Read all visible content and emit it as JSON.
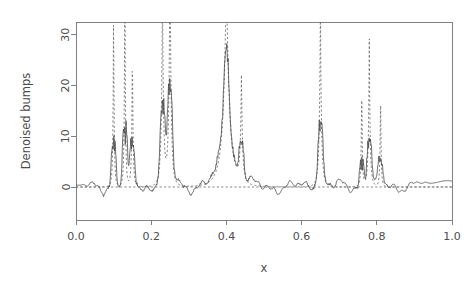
{
  "chart_data": {
    "type": "line",
    "title": "",
    "xlabel": "x",
    "ylabel": "Denoised bumps",
    "xlim": [
      0.0,
      1.0
    ],
    "ylim": [
      -6.5,
      32.5
    ],
    "xticks": [
      0.0,
      0.2,
      0.4,
      0.6,
      0.8,
      1.0
    ],
    "xticklabels": [
      "0.0",
      "0.2",
      "0.4",
      "0.6",
      "0.8",
      "1.0"
    ],
    "yticks": [
      0,
      10,
      20,
      30
    ],
    "yticklabels": [
      "0",
      "10",
      "20",
      "30"
    ],
    "grid": false,
    "legend": "none",
    "zero_reference": 0,
    "series": [
      {
        "name": "True bumps signal",
        "style": "dashed",
        "color": "#6f6f6f",
        "description": "Donoho-Johnstone bumps test function: narrow spikes on a zero baseline",
        "bump_positions": [
          0.1,
          0.13,
          0.15,
          0.23,
          0.25,
          0.4,
          0.44,
          0.65,
          0.76,
          0.78,
          0.81
        ],
        "bump_heights": [
          40.0,
          50.1,
          30.1,
          40.0,
          50.2,
          42.4,
          21.6,
          36.0,
          24.1,
          30.0,
          21.1
        ],
        "bump_widths": [
          0.005,
          0.005,
          0.006,
          0.01,
          0.01,
          0.03,
          0.01,
          0.01,
          0.005,
          0.008,
          0.005
        ]
      },
      {
        "name": "Denoised estimate",
        "style": "solid",
        "color": "#4a4a4a",
        "description": "Wavelet-thresholded reconstruction of noisy bumps; tracks peaks with oscillatory artifacts near discontinuities"
      }
    ],
    "n_points": 1024
  },
  "axes": {
    "y_title": "Denoised bumps",
    "x_title": "x"
  }
}
